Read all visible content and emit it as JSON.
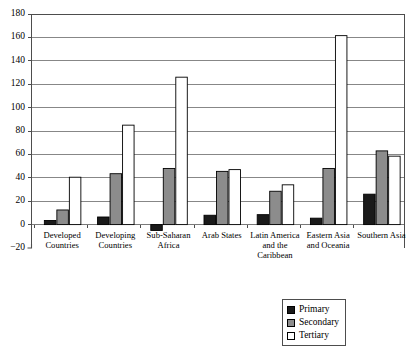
{
  "chart_data": {
    "type": "bar",
    "title": "",
    "subtitle": "",
    "xlabel": "",
    "ylabel": "",
    "ylim": [
      -20,
      180
    ],
    "ytick_step": 20,
    "yticks": [
      180,
      160,
      140,
      120,
      100,
      80,
      60,
      40,
      20,
      0,
      -20
    ],
    "ytick_labels": [
      "180",
      "160",
      "140",
      "120",
      "100",
      "80",
      "60",
      "40",
      "20",
      "0",
      "−20"
    ],
    "grid": true,
    "grid_axis": "y",
    "legend_position": "bottom-right",
    "categories": [
      "Developed Countries",
      "Developing Countries",
      "Sub-Saharan Africa",
      "Arab States",
      "Latin America and the Caribbean",
      "Eastern Asia and Oceania",
      "Southern Asia"
    ],
    "category_lines": [
      [
        "Developed",
        "Countries"
      ],
      [
        "Developing",
        "Countries"
      ],
      [
        "Sub-Saharan",
        "Africa"
      ],
      [
        "Arab States"
      ],
      [
        "Latin America",
        "and the",
        "Caribbean"
      ],
      [
        "Eastern Asia",
        "and Oceania"
      ],
      [
        "Southern Asia"
      ]
    ],
    "series": [
      {
        "name": "Primary",
        "color": "#1a1a1a",
        "border": "#000000",
        "values": [
          3.5,
          6.5,
          -5.0,
          8.0,
          8.5,
          5.5,
          26.0
        ]
      },
      {
        "name": "Secondary",
        "color": "#8c8c8c",
        "border": "#000000",
        "values": [
          12.5,
          43.5,
          48.0,
          45.5,
          28.5,
          48.0,
          63.0
        ]
      },
      {
        "name": "Tertiary",
        "color": "#ffffff",
        "border": "#000000",
        "values": [
          40.5,
          85.0,
          126.0,
          47.0,
          34.0,
          161.5,
          58.5
        ]
      }
    ]
  },
  "legend": {
    "items": [
      {
        "label": "Primary",
        "color": "#1a1a1a"
      },
      {
        "label": "Secondary",
        "color": "#8c8c8c"
      },
      {
        "label": "Tertiary",
        "color": "#ffffff"
      }
    ]
  },
  "style": {
    "axis_color": "#4d4d4d",
    "grid_color": "#7a7a7a",
    "plot_border_color": "#4d4d4d",
    "background": "#ffffff"
  }
}
